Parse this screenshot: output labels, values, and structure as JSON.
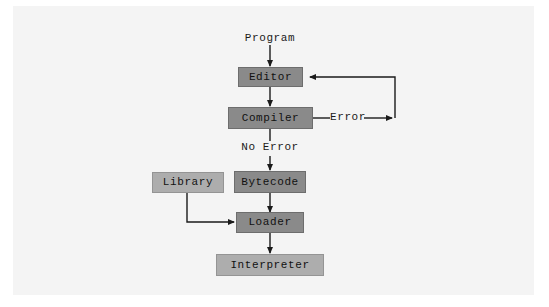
{
  "figure": {
    "background_color": "#ffffff",
    "panel_color": "#f4f4f4",
    "line_color": "#1a1a1a",
    "box_dark_color": "#8a8a8a",
    "box_light_color": "#adadad"
  },
  "nodes": [
    {
      "id": "editor",
      "label": "Editor",
      "shade": "dark"
    },
    {
      "id": "compiler",
      "label": "Compiler",
      "shade": "dark"
    },
    {
      "id": "bytecode",
      "label": "Bytecode",
      "shade": "dark"
    },
    {
      "id": "loader",
      "label": "Loader",
      "shade": "dark"
    },
    {
      "id": "library",
      "label": "Library",
      "shade": "light"
    },
    {
      "id": "interpreter",
      "label": "Interpreter",
      "shade": "light"
    }
  ],
  "labels": {
    "program": "Program",
    "error": "Error",
    "no_error": "No Error"
  },
  "edges": [
    {
      "id": "program-to-editor",
      "from": "Program",
      "to": "Editor",
      "label": ""
    },
    {
      "id": "editor-to-compiler",
      "from": "Editor",
      "to": "Compiler",
      "label": ""
    },
    {
      "id": "compiler-to-editor",
      "from": "Compiler",
      "to": "Editor",
      "label": "Error"
    },
    {
      "id": "compiler-to-bytecode",
      "from": "Compiler",
      "to": "Bytecode",
      "label": "No Error"
    },
    {
      "id": "bytecode-to-loader",
      "from": "Bytecode",
      "to": "Loader",
      "label": ""
    },
    {
      "id": "library-to-loader",
      "from": "Library",
      "to": "Loader",
      "label": ""
    },
    {
      "id": "loader-to-interpreter",
      "from": "Loader",
      "to": "Interpreter",
      "label": ""
    }
  ]
}
